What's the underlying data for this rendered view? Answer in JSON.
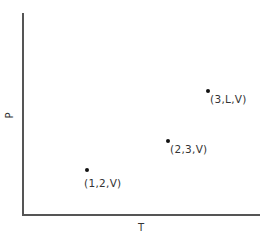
{
  "diagram": {
    "type": "phase-diagram-sketch",
    "axes": {
      "x_label": "T",
      "y_label": "P"
    },
    "points": [
      {
        "label": "(1,2,V)",
        "x": 87,
        "y": 170
      },
      {
        "label": "(2,3,V)",
        "x": 168,
        "y": 141
      },
      {
        "label": "(3,L,V)",
        "x": 208,
        "y": 91
      }
    ]
  }
}
